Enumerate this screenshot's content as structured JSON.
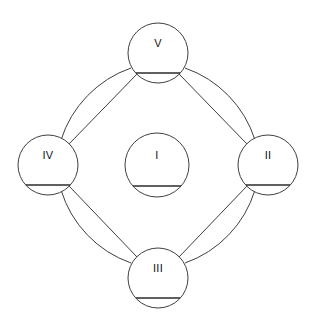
{
  "diagram": {
    "title": "",
    "background_color": "#ffffff",
    "stroke_color": "#3f3f3f",
    "text_color": "#111111",
    "rule_color": "#2b2b2b",
    "canvas": {
      "width": 317,
      "height": 329
    },
    "node_radius": 30,
    "center_node_radius": 32,
    "ring_radius": 112,
    "nodes": [
      {
        "id": "center",
        "label": "I",
        "cx": 157,
        "cy": 165,
        "r": 32,
        "position": "center",
        "rule_width": 48,
        "rule_dy": 21
      },
      {
        "id": "right",
        "label": "II",
        "cx": 268,
        "cy": 165,
        "r": 30,
        "position": "right",
        "rule_width": 44,
        "rule_dy": 20
      },
      {
        "id": "bottom",
        "label": "III",
        "cx": 158,
        "cy": 278,
        "r": 30,
        "position": "bottom",
        "rule_width": 44,
        "rule_dy": 20
      },
      {
        "id": "left",
        "label": "IV",
        "cx": 48,
        "cy": 165,
        "r": 30,
        "position": "left",
        "rule_width": 44,
        "rule_dy": 20
      },
      {
        "id": "top",
        "label": "V",
        "cx": 158,
        "cy": 53,
        "r": 30,
        "position": "top",
        "rule_width": 44,
        "rule_dy": 20
      }
    ],
    "arc_edges": [
      {
        "id": "arc-top-right",
        "from": "top",
        "to": "right",
        "path": "M 185 68 A 112 112 0 0 1 255 140"
      },
      {
        "id": "arc-right-bottom",
        "from": "right",
        "to": "bottom",
        "path": "M 255 190 A 112 112 0 0 1 185 263"
      },
      {
        "id": "arc-bottom-left",
        "from": "bottom",
        "to": "left",
        "path": "M 131 263 A 112 112 0 0 1 61 190"
      },
      {
        "id": "arc-left-top",
        "from": "left",
        "to": "top",
        "path": "M 61 140 A 112 112 0 0 1 131 68"
      }
    ],
    "chord_edges": [
      {
        "id": "chord-top-right",
        "from": "top",
        "to": "right",
        "x1": 179,
        "y1": 74,
        "x2": 247,
        "y2": 144
      },
      {
        "id": "chord-right-bottom",
        "from": "right",
        "to": "bottom",
        "x1": 247,
        "y1": 186,
        "x2": 179,
        "y2": 257
      },
      {
        "id": "chord-bottom-left",
        "from": "bottom",
        "to": "left",
        "x1": 137,
        "y1": 257,
        "x2": 69,
        "y2": 186
      },
      {
        "id": "chord-left-top",
        "from": "left",
        "to": "top",
        "x1": 69,
        "y1": 144,
        "x2": 137,
        "y2": 74
      }
    ]
  }
}
